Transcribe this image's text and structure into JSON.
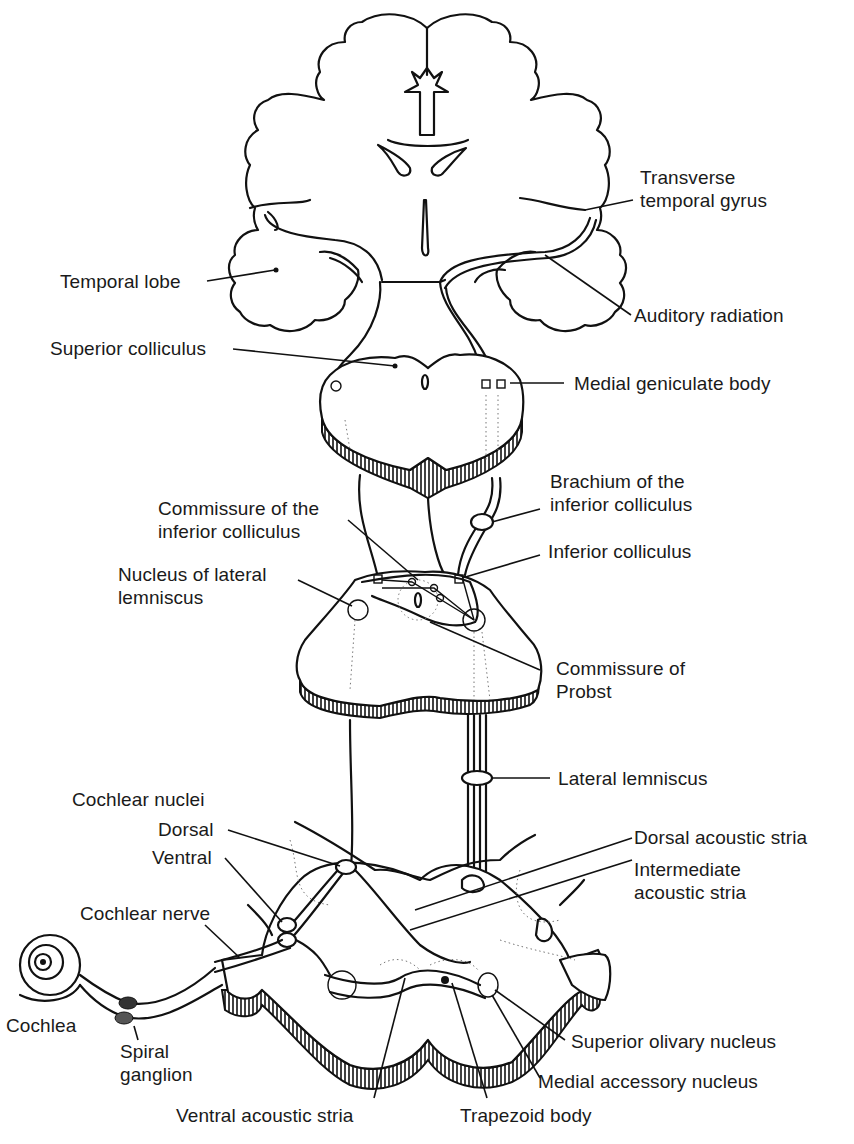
{
  "figure": {
    "colors": {
      "ink": "#111111",
      "background": "#ffffff"
    }
  },
  "labels": {
    "transverse_temporal_gyrus": [
      "Transverse",
      "temporal gyrus"
    ],
    "temporal_lobe": "Temporal lobe",
    "auditory_radiation": "Auditory radiation",
    "superior_colliculus": "Superior colliculus",
    "medial_geniculate_body": "Medial geniculate body",
    "brachium_inferior_colliculus": [
      "Brachium of the",
      "inferior colliculus"
    ],
    "commissure_inferior_colliculus": [
      "Commissure of the",
      "inferior colliculus"
    ],
    "inferior_colliculus": "Inferior colliculus",
    "nucleus_lateral_lemniscus": [
      "Nucleus of lateral",
      "lemniscus"
    ],
    "commissure_of_probst": [
      "Commissure of",
      "Probst"
    ],
    "lateral_lemniscus": "Lateral lemniscus",
    "cochlear_nuclei": "Cochlear nuclei",
    "dorsal": "Dorsal",
    "ventral": "Ventral",
    "dorsal_acoustic_stria": "Dorsal acoustic stria",
    "intermediate_acoustic_stria": [
      "Intermediate",
      "acoustic stria"
    ],
    "cochlear_nerve": "Cochlear nerve",
    "cochlea": "Cochlea",
    "spiral_ganglion": [
      "Spiral",
      "ganglion"
    ],
    "superior_olivary_nucleus": "Superior olivary nucleus",
    "medial_accessory_nucleus": "Medial accessory nucleus",
    "ventral_acoustic_stria": "Ventral acoustic stria",
    "trapezoid_body": "Trapezoid body"
  }
}
